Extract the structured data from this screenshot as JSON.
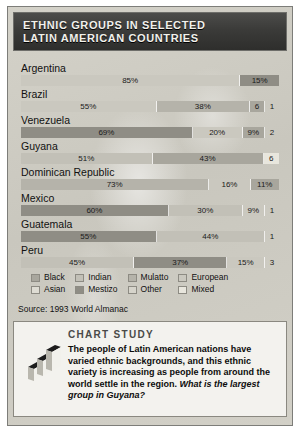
{
  "title": {
    "line1": "ETHNIC GROUPS IN SELECTED",
    "line2": "LATIN AMERICAN COUNTRIES"
  },
  "source": "Source: 1993 World Almanac",
  "legend": {
    "columns": [
      [
        {
          "label": "Black",
          "key": "black"
        },
        {
          "label": "Asian",
          "key": "asian"
        }
      ],
      [
        {
          "label": "Indian",
          "key": "indian"
        },
        {
          "label": "Mestizo",
          "key": "mestizo"
        }
      ],
      [
        {
          "label": "Mulatto",
          "key": "mulatto"
        },
        {
          "label": "Other",
          "key": "other"
        }
      ],
      [
        {
          "label": "European",
          "key": "european"
        },
        {
          "label": "Mixed",
          "key": "mixed"
        }
      ]
    ]
  },
  "study": {
    "heading": "CHART STUDY",
    "body": "The people of Latin American nations have varied ethnic backgrounds, and this ethnic variety is increasing as people from around the world settle in the region. ",
    "question": "What is the largest group in Guyana?",
    "icon": "bar-chart-3d-icon"
  },
  "chart_data": {
    "type": "bar",
    "orientation": "horizontal",
    "stacked": true,
    "title": "ETHNIC GROUPS IN SELECTED LATIN AMERICAN COUNTRIES",
    "xlabel": "",
    "ylabel": "",
    "xlim": [
      0,
      100
    ],
    "grid": false,
    "legend_position": "bottom",
    "units": "percent",
    "source": "Source: 1993 World Almanac",
    "categories": [
      "Argentina",
      "Brazil",
      "Venezuela",
      "Guyana",
      "Dominican Republic",
      "Mexico",
      "Guatemala",
      "Peru"
    ],
    "series": [
      {
        "name": "Argentina",
        "segments": [
          {
            "group": "european",
            "value": 85,
            "label": "85%",
            "label_inside": true
          },
          {
            "group": "mestizo",
            "value": 15,
            "label": "15%",
            "label_inside": true
          }
        ]
      },
      {
        "name": "Brazil",
        "segments": [
          {
            "group": "european",
            "value": 55,
            "label": "55%",
            "label_inside": true
          },
          {
            "group": "mulatto",
            "value": 38,
            "label": "38%",
            "label_inside": true
          },
          {
            "group": "black",
            "value": 6,
            "label": "6",
            "label_inside": true
          },
          {
            "group": "other",
            "value": 1,
            "label": "1",
            "label_inside": false
          }
        ]
      },
      {
        "name": "Venezuela",
        "segments": [
          {
            "group": "mestizo",
            "value": 69,
            "label": "69%",
            "label_inside": true
          },
          {
            "group": "european",
            "value": 20,
            "label": "20%",
            "label_inside": true
          },
          {
            "group": "black",
            "value": 9,
            "label": "9%",
            "label_inside": true
          },
          {
            "group": "indian",
            "value": 2,
            "label": "2",
            "label_inside": false
          }
        ]
      },
      {
        "name": "Guyana",
        "segments": [
          {
            "group": "indian",
            "value": 51,
            "label": "51%",
            "label_inside": true
          },
          {
            "group": "black",
            "value": 43,
            "label": "43%",
            "label_inside": true
          },
          {
            "group": "mixed",
            "value": 6,
            "label": "6",
            "label_inside": true
          }
        ]
      },
      {
        "name": "Dominican Republic",
        "segments": [
          {
            "group": "mulatto",
            "value": 73,
            "label": "73%",
            "label_inside": true
          },
          {
            "group": "european",
            "value": 16,
            "label": "16%",
            "label_inside": true
          },
          {
            "group": "black",
            "value": 11,
            "label": "11%",
            "label_inside": true
          }
        ]
      },
      {
        "name": "Mexico",
        "segments": [
          {
            "group": "mestizo",
            "value": 60,
            "label": "60%",
            "label_inside": true
          },
          {
            "group": "indian",
            "value": 30,
            "label": "30%",
            "label_inside": true
          },
          {
            "group": "european",
            "value": 9,
            "label": "9%",
            "label_inside": true
          },
          {
            "group": "other",
            "value": 1,
            "label": "1",
            "label_inside": false
          }
        ]
      },
      {
        "name": "Guatemala",
        "segments": [
          {
            "group": "mestizo",
            "value": 55,
            "label": "55%",
            "label_inside": true
          },
          {
            "group": "indian",
            "value": 44,
            "label": "44%",
            "label_inside": true
          },
          {
            "group": "other",
            "value": 1,
            "label": "1",
            "label_inside": false
          }
        ]
      },
      {
        "name": "Peru",
        "segments": [
          {
            "group": "indian",
            "value": 45,
            "label": "45%",
            "label_inside": true
          },
          {
            "group": "mestizo",
            "value": 37,
            "label": "37%",
            "label_inside": true
          },
          {
            "group": "european",
            "value": 15,
            "label": "15%",
            "label_inside": true
          },
          {
            "group": "other",
            "value": 3,
            "label": "3",
            "label_inside": false
          }
        ]
      }
    ]
  }
}
